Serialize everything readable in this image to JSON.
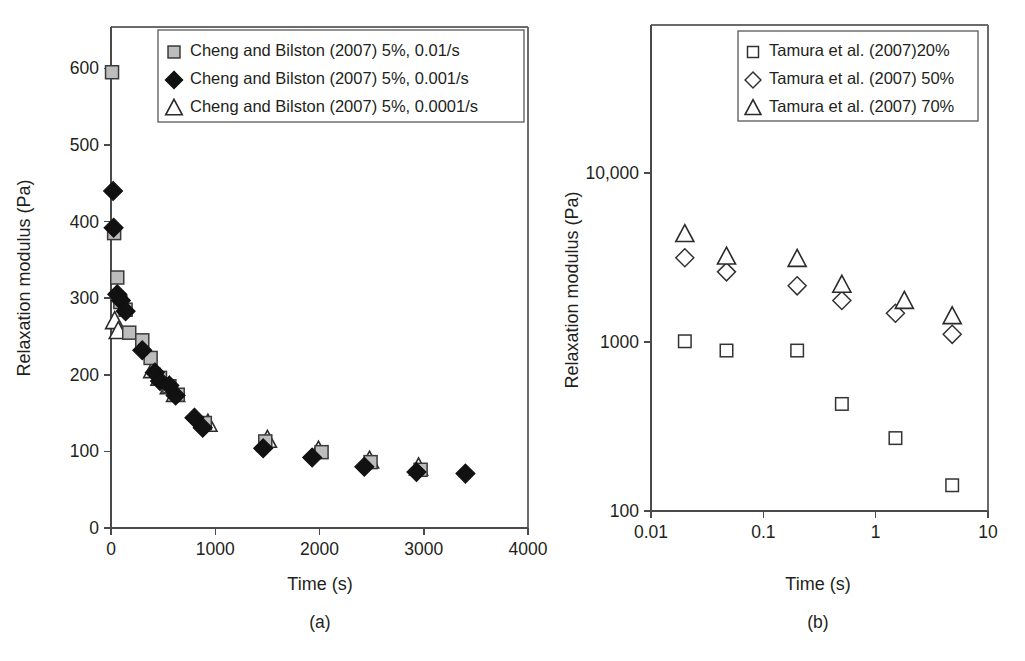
{
  "figure": {
    "panels": [
      {
        "caption": "(a)",
        "legend": {
          "entries": [
            {
              "marker": "square-gray-filled",
              "label": "Cheng and Bilston (2007) 5%, 0.01/s"
            },
            {
              "marker": "diamond-filled",
              "label": "Cheng and Bilston (2007) 5%, 0.001/s"
            },
            {
              "marker": "triangle-open",
              "label": "Cheng and Bilston (2007) 5%, 0.0001/s"
            }
          ]
        }
      },
      {
        "caption": "(b)",
        "legend": {
          "entries": [
            {
              "marker": "square-open",
              "label": "Tamura et al. (2007)20%"
            },
            {
              "marker": "diamond-open",
              "label": "Tamura et al. (2007) 50%"
            },
            {
              "marker": "triangle-open",
              "label": "Tamura et al. (2007) 70%"
            }
          ]
        }
      }
    ]
  },
  "chart_data": [
    {
      "type": "scatter",
      "panel": "(a)",
      "title": "",
      "xlabel": "Time (s)",
      "ylabel": "Relaxation modulus (Pa)",
      "xscale": "linear",
      "yscale": "linear",
      "xlim": [
        0,
        4000
      ],
      "ylim": [
        0,
        650
      ],
      "xticks": [
        0,
        1000,
        2000,
        3000,
        4000
      ],
      "xtick_labels": [
        "0",
        "1000",
        "2000",
        "3000",
        "4000"
      ],
      "yticks": [
        0,
        100,
        200,
        300,
        400,
        500,
        600
      ],
      "ytick_labels": [
        "0",
        "100",
        "200",
        "300",
        "400",
        "500",
        "600"
      ],
      "grid": false,
      "legend_position": "top-left-inside",
      "series": [
        {
          "name": "Cheng and Bilston (2007) 5%, 0.01/s",
          "marker": "square-gray-filled",
          "points": [
            [
              10,
              595
            ],
            [
              30,
              385
            ],
            [
              60,
              327
            ],
            [
              90,
              295
            ],
            [
              140,
              285
            ],
            [
              175,
              255
            ],
            [
              300,
              245
            ],
            [
              380,
              222
            ],
            [
              470,
              196
            ],
            [
              560,
              185
            ],
            [
              640,
              174
            ],
            [
              900,
              137
            ],
            [
              1480,
              113
            ],
            [
              2020,
              99
            ],
            [
              2490,
              86
            ],
            [
              2970,
              76
            ]
          ]
        },
        {
          "name": "Cheng and Bilston (2007) 5%, 0.001/s",
          "marker": "diamond-filled",
          "points": [
            [
              20,
              440
            ],
            [
              25,
              392
            ],
            [
              60,
              305
            ],
            [
              95,
              297
            ],
            [
              140,
              283
            ],
            [
              300,
              232
            ],
            [
              420,
              203
            ],
            [
              470,
              192
            ],
            [
              560,
              186
            ],
            [
              620,
              173
            ],
            [
              800,
              144
            ],
            [
              880,
              131
            ],
            [
              1460,
              104
            ],
            [
              1930,
              92
            ],
            [
              2430,
              80
            ],
            [
              2930,
              73
            ],
            [
              3400,
              71
            ]
          ]
        },
        {
          "name": "Cheng and Bilston (2007) 5%, 0.0001/s",
          "marker": "triangle-open",
          "points": [
            [
              35,
              270
            ],
            [
              70,
              257
            ],
            [
              400,
              206
            ],
            [
              470,
              196
            ],
            [
              560,
              185
            ],
            [
              620,
              175
            ],
            [
              930,
              136
            ],
            [
              1500,
              115
            ],
            [
              1990,
              101
            ],
            [
              2480,
              88
            ],
            [
              2950,
              79
            ]
          ]
        }
      ]
    },
    {
      "type": "scatter",
      "panel": "(b)",
      "title": "",
      "xlabel": "Time (s)",
      "ylabel": "Relaxation modulus (Pa)",
      "xscale": "log",
      "yscale": "log",
      "xlim": [
        0.01,
        10
      ],
      "ylim": [
        100,
        30000
      ],
      "xticks": [
        0.01,
        0.1,
        1,
        10
      ],
      "xtick_labels": [
        "0.01",
        "0.1",
        "1",
        "10"
      ],
      "yticks": [
        100,
        1000,
        10000
      ],
      "ytick_labels": [
        "100",
        "1000",
        "10,000"
      ],
      "grid": false,
      "legend_position": "top-right-inside",
      "series": [
        {
          "name": "Tamura et al. (2007)20%",
          "marker": "square-open",
          "points": [
            [
              0.02,
              1010
            ],
            [
              0.047,
              890
            ],
            [
              0.2,
              890
            ],
            [
              0.5,
              430
            ],
            [
              1.5,
              270
            ],
            [
              4.8,
              142
            ]
          ]
        },
        {
          "name": "Tamura et al. (2007) 50%",
          "marker": "diamond-open",
          "points": [
            [
              0.02,
              3150
            ],
            [
              0.047,
              2600
            ],
            [
              0.2,
              2150
            ],
            [
              0.5,
              1760
            ],
            [
              1.5,
              1480
            ],
            [
              4.8,
              1110
            ]
          ]
        },
        {
          "name": "Tamura et al. (2007) 70%",
          "marker": "triangle-open",
          "points": [
            [
              0.02,
              4350
            ],
            [
              0.047,
              3200
            ],
            [
              0.2,
              3100
            ],
            [
              0.5,
              2180
            ],
            [
              1.8,
              1750
            ],
            [
              4.8,
              1420
            ]
          ]
        }
      ]
    }
  ]
}
